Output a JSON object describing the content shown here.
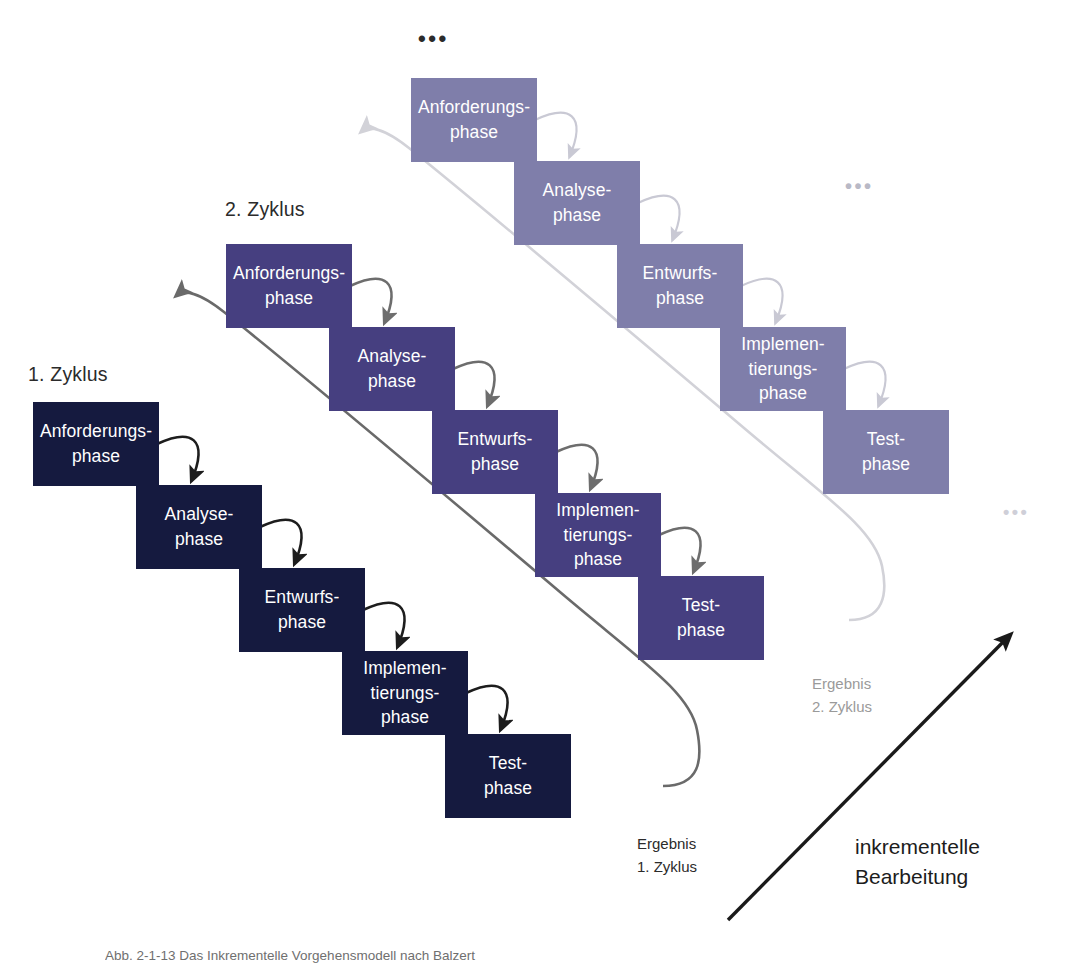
{
  "figure": {
    "background_color": "#ffffff",
    "top_ellipsis": "•••",
    "bottom_ellipsis": "•••",
    "incremental_label": "inkrementelle\nBearbeitung"
  },
  "colors": {
    "cycle1_box": "#151a3f",
    "cycle2_box": "#463f80",
    "cycle3_box": "#7f7eaa",
    "cycle1_arrow": "#1d1d1d",
    "cycle2_arrow": "#6d6d6d",
    "cycle3_arrow": "#c9c9d4",
    "cycle1_feedback": "#6a6a6a",
    "cycle2_feedback": "#d2d2d8",
    "incremental_arrow": "#1a1a1a",
    "label_text": "#2b2b2b",
    "box_text": "#ffffff"
  },
  "cycles": [
    {
      "id": "cycle-1",
      "label": "1. Zyklus",
      "label_x": 28,
      "label_y": 363,
      "color": "#151a3f",
      "arrow_color": "#1d1d1d",
      "origin_x": 33,
      "origin_y": 402,
      "result_label": "Ergebnis\n1. Zyklus",
      "result_color": "#2b2b2b",
      "result_x": 637,
      "result_y": 832,
      "phases": [
        {
          "name": "Anforderungs-\nphase"
        },
        {
          "name": "Analyse-\nphase"
        },
        {
          "name": "Entwurfs-\nphase"
        },
        {
          "name": "Implemen-\ntierungs-\nphase"
        },
        {
          "name": "Test-\nphase"
        }
      ]
    },
    {
      "id": "cycle-2",
      "label": "2. Zyklus",
      "label_x": 225,
      "label_y": 198,
      "color": "#463f80",
      "arrow_color": "#6d6d6d",
      "origin_x": 226,
      "origin_y": 244,
      "result_label": "Ergebnis\n2. Zyklus",
      "result_color": "#9a9a9a",
      "result_x": 812,
      "result_y": 672,
      "phases": [
        {
          "name": "Anforderungs-\nphase"
        },
        {
          "name": "Analyse-\nphase"
        },
        {
          "name": "Entwurfs-\nphase"
        },
        {
          "name": "Implemen-\ntierungs-\nphase"
        },
        {
          "name": "Test-\nphase"
        }
      ]
    },
    {
      "id": "cycle-3",
      "label": "",
      "label_x": 0,
      "label_y": 0,
      "color": "#7f7eaa",
      "arrow_color": "#c9c9d4",
      "origin_x": 411,
      "origin_y": 78,
      "result_label": "",
      "result_color": "#c9c9c9",
      "result_x": 0,
      "result_y": 0,
      "phases": [
        {
          "name": "Anforderungs-\nphase"
        },
        {
          "name": "Analyse-\nphase"
        },
        {
          "name": "Entwurfs-\nphase"
        },
        {
          "name": "Implemen-\ntierungs-\nphase"
        },
        {
          "name": "Test-\nphase"
        }
      ]
    }
  ],
  "box_geometry": {
    "width": 126,
    "height": 84,
    "step_x": 103,
    "step_y": 83
  },
  "ellipses": [
    {
      "name": "top-ellipsis",
      "text": "•••",
      "x": 418,
      "y": 28,
      "color": "#2b2b2b",
      "size": 22
    },
    {
      "name": "mid-ellipsis",
      "text": "•••",
      "x": 845,
      "y": 176,
      "color": "#b9b9c6",
      "size": 20
    },
    {
      "name": "bottom-ellipsis",
      "text": "•••",
      "x": 1003,
      "y": 503,
      "color": "#cfcfd8",
      "size": 18
    }
  ],
  "caption": {
    "text": "Abb. 2-1-13  Das Inkrementelle Vorgehensmodell nach Balzert"
  }
}
